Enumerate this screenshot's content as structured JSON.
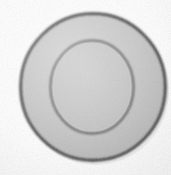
{
  "image": {
    "subject_name": "concentric-disc",
    "description": "Low-resolution scanned photograph of a round flat gray disc with a raised concentric inner rim, centered on a plain white background",
    "canvas_width": 171,
    "canvas_height": 175,
    "background_color": "#fefefe",
    "has_visible_text": false,
    "quality_note": "grainy, soft focus, slightly lossy scan"
  },
  "shapes": {
    "outer_disc": {
      "name": "outer-disc",
      "center_x": 93,
      "center_y": 87,
      "radius_x": 73,
      "radius_y": 74,
      "fill_color": "#c2c2c2",
      "stroke_color": "#242424",
      "stroke_width": 2.6,
      "bounds": {
        "left": 20,
        "top": 13,
        "right": 166,
        "bottom": 161
      }
    },
    "inner_circle": {
      "name": "inner-circle",
      "center_x": 92,
      "center_y": 87,
      "radius_x": 42,
      "radius_y": 47,
      "fill_color": "#c3c3c3",
      "stroke_color": "#4a4a4a",
      "stroke_width": 2.0,
      "bounds": {
        "left": 50,
        "top": 40,
        "right": 134,
        "bottom": 134
      }
    }
  },
  "palette": {
    "background": "#fefefe",
    "disc_gray": "#c2c2c2",
    "disc_gray_light": "#cfcfcf",
    "disc_gray_dark": "#b2b2b2",
    "outer_outline": "#242424",
    "inner_outline": "#4a4a4a",
    "shadow_tint": "#9a9a9a"
  }
}
